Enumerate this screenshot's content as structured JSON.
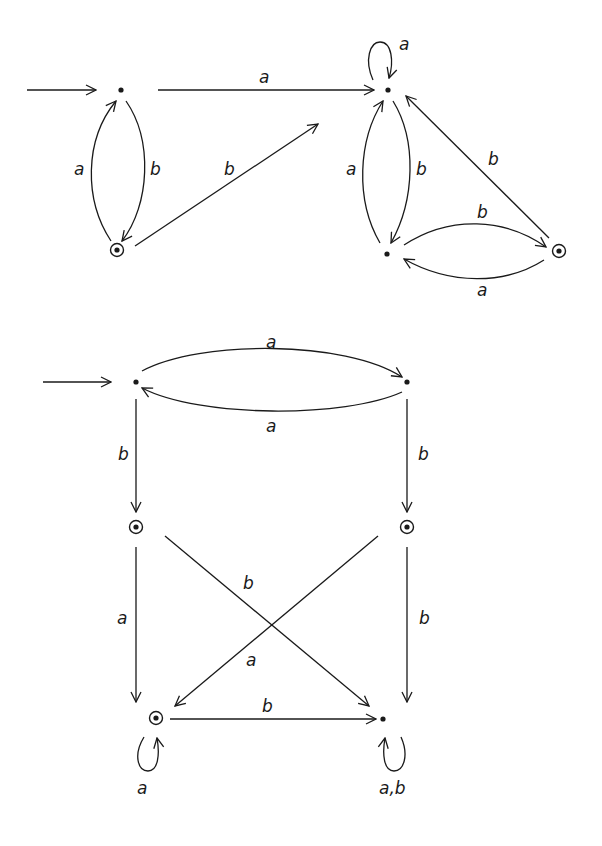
{
  "diagrams": [
    {
      "name": "automaton-top",
      "states": [
        {
          "id": "q0",
          "x": 121,
          "y": 90,
          "initial": true,
          "accepting": false
        },
        {
          "id": "q1",
          "x": 117,
          "y": 250,
          "initial": false,
          "accepting": true
        },
        {
          "id": "q2",
          "x": 388,
          "y": 90,
          "initial": false,
          "accepting": false
        },
        {
          "id": "q3",
          "x": 387,
          "y": 254,
          "initial": false,
          "accepting": false
        },
        {
          "id": "q4",
          "x": 559,
          "y": 251,
          "initial": false,
          "accepting": true
        }
      ],
      "transitions": [
        {
          "from": "q0",
          "to": "q2",
          "label": "a"
        },
        {
          "from": "q0",
          "to": "q1",
          "label": "b"
        },
        {
          "from": "q1",
          "to": "q0",
          "label": "a"
        },
        {
          "from": "q1",
          "to": "q2",
          "label": "b"
        },
        {
          "from": "q2",
          "to": "q2",
          "label": "a"
        },
        {
          "from": "q2",
          "to": "q3",
          "label": "b"
        },
        {
          "from": "q3",
          "to": "q2",
          "label": "a"
        },
        {
          "from": "q3",
          "to": "q4",
          "label": "b"
        },
        {
          "from": "q4",
          "to": "q3",
          "label": "a"
        },
        {
          "from": "q4",
          "to": "q2",
          "label": "b"
        }
      ]
    },
    {
      "name": "automaton-bottom",
      "states": [
        {
          "id": "p0",
          "x": 136,
          "y": 382,
          "initial": true,
          "accepting": false
        },
        {
          "id": "p1",
          "x": 407,
          "y": 382,
          "initial": false,
          "accepting": false
        },
        {
          "id": "p2",
          "x": 136,
          "y": 527,
          "initial": false,
          "accepting": true
        },
        {
          "id": "p3",
          "x": 407,
          "y": 527,
          "initial": false,
          "accepting": true
        },
        {
          "id": "p4",
          "x": 156,
          "y": 718,
          "initial": false,
          "accepting": true
        },
        {
          "id": "p5",
          "x": 383,
          "y": 719,
          "initial": false,
          "accepting": false
        }
      ],
      "transitions": [
        {
          "from": "p0",
          "to": "p1",
          "label": "a"
        },
        {
          "from": "p1",
          "to": "p0",
          "label": "a"
        },
        {
          "from": "p0",
          "to": "p2",
          "label": "b"
        },
        {
          "from": "p1",
          "to": "p3",
          "label": "b"
        },
        {
          "from": "p2",
          "to": "p4",
          "label": "a"
        },
        {
          "from": "p2",
          "to": "p5",
          "label": "b"
        },
        {
          "from": "p3",
          "to": "p4",
          "label": "a"
        },
        {
          "from": "p3",
          "to": "p5",
          "label": "b"
        },
        {
          "from": "p4",
          "to": "p5",
          "label": "b"
        },
        {
          "from": "p4",
          "to": "p4",
          "label": "a"
        },
        {
          "from": "p5",
          "to": "p5",
          "label": "a,b"
        }
      ]
    }
  ],
  "labels": {
    "top": {
      "q0_q2": "a",
      "q1_q0": "a",
      "q0_q1": "b",
      "q1_q2": "b",
      "q2_loop": "a",
      "q3_q2": "a",
      "q2_q3": "b",
      "q4_q2": "b",
      "q3_q4": "b",
      "q4_q3": "a"
    },
    "bottom": {
      "p0_p1": "a",
      "p1_p0": "a",
      "p0_p2": "b",
      "p1_p3": "b",
      "p2_p4": "a",
      "p2_p5": "b",
      "p3_p4": "a",
      "p3_p5": "b",
      "p4_p5": "b",
      "p4_loop": "a",
      "p5_loop": "a,b"
    }
  },
  "colors": {
    "ink": "#1a1a1a",
    "background": "#ffffff"
  }
}
